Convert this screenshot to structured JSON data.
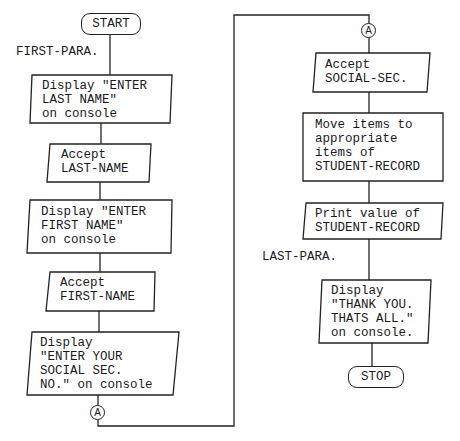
{
  "diagram": {
    "type": "flowchart",
    "left_column": {
      "start": "START",
      "paragraph_label": "FIRST-PARA.",
      "steps": [
        {
          "shape": "io",
          "lines": [
            "Display \"ENTER",
            "LAST NAME\"",
            "on console"
          ]
        },
        {
          "shape": "io",
          "lines": [
            "Accept",
            "LAST-NAME"
          ]
        },
        {
          "shape": "io",
          "lines": [
            "Display \"ENTER",
            "FIRST NAME\"",
            "on console"
          ]
        },
        {
          "shape": "io",
          "lines": [
            "Accept",
            "FIRST-NAME"
          ]
        },
        {
          "shape": "io",
          "lines": [
            "Display",
            "\"ENTER YOUR",
            "SOCIAL SEC.",
            "NO.\" on console"
          ]
        }
      ],
      "connector_out": "A"
    },
    "right_column": {
      "connector_in": "A",
      "steps": [
        {
          "shape": "io",
          "lines": [
            "Accept",
            "SOCIAL-SEC."
          ]
        },
        {
          "shape": "process",
          "lines": [
            "Move items to",
            "appropriate",
            "items of",
            "STUDENT-RECORD"
          ]
        },
        {
          "shape": "io",
          "lines": [
            "Print value of",
            "STUDENT-RECORD"
          ]
        }
      ],
      "paragraph_label": "LAST-PARA.",
      "final_step": {
        "shape": "io",
        "lines": [
          "Display",
          "\"THANK YOU.",
          "THATS ALL.\"",
          "on console."
        ]
      },
      "stop": "STOP"
    }
  }
}
